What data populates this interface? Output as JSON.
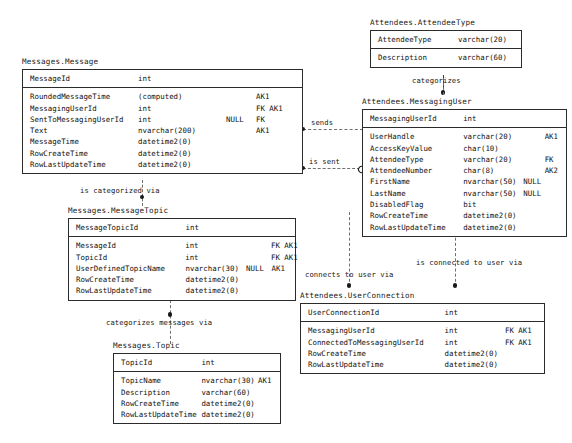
{
  "diagram": {
    "type": "entity-relationship-diagram",
    "background": "#ffffff",
    "line_color": "#3a3a3a"
  },
  "entities": [
    {
      "id": "attendee_type",
      "title": "Attendees.AttendeeType",
      "pk": [
        {
          "name": "AttendeeType",
          "type": "varchar(20)",
          "nullability": "",
          "key": ""
        }
      ],
      "attributes": [
        {
          "name": "Description",
          "type": "varchar(60)",
          "nullability": "",
          "key": ""
        }
      ]
    },
    {
      "id": "message",
      "title": "Messages.Message",
      "pk": [
        {
          "name": "MessageId",
          "type": "int",
          "nullability": "",
          "key": ""
        }
      ],
      "attributes": [
        {
          "name": "RoundedMessageTime",
          "type": "(computed)",
          "nullability": "",
          "key": "AK1"
        },
        {
          "name": "MessagingUserId",
          "type": "int",
          "nullability": "",
          "key": "FK AK1"
        },
        {
          "name": "SentToMessagingUserId",
          "type": "int",
          "nullability": "NULL",
          "key": "FK"
        },
        {
          "name": "Text",
          "type": "nvarchar(200)",
          "nullability": "",
          "key": "AK1"
        },
        {
          "name": "MessageTime",
          "type": "datetime2(0)",
          "nullability": "",
          "key": ""
        },
        {
          "name": "RowCreateTime",
          "type": "datetime2(0)",
          "nullability": "",
          "key": ""
        },
        {
          "name": "RowLastUpdateTime",
          "type": "datetime2(0)",
          "nullability": "",
          "key": ""
        }
      ]
    },
    {
      "id": "messaging_user",
      "title": "Attendees.MessagingUser",
      "pk": [
        {
          "name": "MessagingUserId",
          "type": "int",
          "nullability": "",
          "key": ""
        }
      ],
      "attributes": [
        {
          "name": "UserHandle",
          "type": "varchar(20)",
          "nullability": "",
          "key": "AK1"
        },
        {
          "name": "AccessKeyValue",
          "type": "char(10)",
          "nullability": "",
          "key": ""
        },
        {
          "name": "AttendeeType",
          "type": "varchar(20)",
          "nullability": "",
          "key": "FK"
        },
        {
          "name": "AttendeeNumber",
          "type": "char(8)",
          "nullability": "",
          "key": "AK2"
        },
        {
          "name": "FirstName",
          "type": "nvarchar(50)",
          "nullability": "NULL",
          "key": ""
        },
        {
          "name": "LastName",
          "type": "nvarchar(50)",
          "nullability": "NULL",
          "key": ""
        },
        {
          "name": "DisabledFlag",
          "type": "bit",
          "nullability": "",
          "key": ""
        },
        {
          "name": "RowCreateTime",
          "type": "datetime2(0)",
          "nullability": "",
          "key": ""
        },
        {
          "name": "RowLastUpdateTime",
          "type": "datetime2(0)",
          "nullability": "",
          "key": ""
        }
      ]
    },
    {
      "id": "message_topic",
      "title": "Messages.MessageTopic",
      "pk": [
        {
          "name": "MessageTopicId",
          "type": "int",
          "nullability": "",
          "key": ""
        }
      ],
      "attributes": [
        {
          "name": "MessageId",
          "type": "int",
          "nullability": "",
          "key": "FK AK1"
        },
        {
          "name": "TopicId",
          "type": "int",
          "nullability": "",
          "key": "FK AK1"
        },
        {
          "name": "UserDefinedTopicName",
          "type": "nvarchar(30)",
          "nullability": "NULL",
          "key": "AK1"
        },
        {
          "name": "RowCreateTime",
          "type": "datetime2(0)",
          "nullability": "",
          "key": ""
        },
        {
          "name": "RowLastUpdateTime",
          "type": "datetime2(0)",
          "nullability": "",
          "key": ""
        }
      ]
    },
    {
      "id": "topic",
      "title": "Messages.Topic",
      "pk": [
        {
          "name": "TopicId",
          "type": "int",
          "nullability": "",
          "key": ""
        }
      ],
      "attributes": [
        {
          "name": "TopicName",
          "type": "nvarchar(30)",
          "nullability": "",
          "key": "AK1"
        },
        {
          "name": "Description",
          "type": "varchar(60)",
          "nullability": "",
          "key": ""
        },
        {
          "name": "RowCreateTime",
          "type": "datetime2(0)",
          "nullability": "",
          "key": ""
        },
        {
          "name": "RowLastUpdateTime",
          "type": "datetime2(0)",
          "nullability": "",
          "key": ""
        }
      ]
    },
    {
      "id": "user_connection",
      "title": "Attendees.UserConnection",
      "pk": [
        {
          "name": "UserConnectionId",
          "type": "int",
          "nullability": "",
          "key": ""
        }
      ],
      "attributes": [
        {
          "name": "MessagingUserId",
          "type": "int",
          "nullability": "",
          "key": "FK AK1"
        },
        {
          "name": "ConnectedToMessagingUserId",
          "type": "int",
          "nullability": "",
          "key": "FK AK1"
        },
        {
          "name": "RowCreateTime",
          "type": "datetime2(0)",
          "nullability": "",
          "key": ""
        },
        {
          "name": "RowLastUpdateTime",
          "type": "datetime2(0)",
          "nullability": "",
          "key": ""
        }
      ]
    }
  ],
  "relationships": [
    {
      "id": "rel_categorizes",
      "label": "categorizes"
    },
    {
      "id": "rel_sends",
      "label": "sends"
    },
    {
      "id": "rel_is_sent",
      "label": "is sent"
    },
    {
      "id": "rel_is_categorized_via",
      "label": "is categorized via"
    },
    {
      "id": "rel_categorizes_messages",
      "label": "categorizes messages via"
    },
    {
      "id": "rel_connects_to_user",
      "label": "connects to user via"
    },
    {
      "id": "rel_is_connected_to_user",
      "label": "is connected to user via"
    }
  ]
}
